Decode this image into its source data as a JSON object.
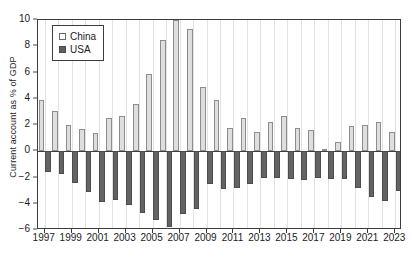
{
  "chart_data": {
    "type": "bar",
    "title": "",
    "xlabel": "",
    "ylabel": "Current account as % of GDP",
    "ylim": [
      -6,
      10
    ],
    "yticks": [
      10,
      8,
      6,
      4,
      2,
      0,
      -2,
      -4,
      -6
    ],
    "ytick_labels": [
      "10",
      "8",
      "6",
      "4",
      "2",
      "0",
      "−2",
      "−4",
      "−6"
    ],
    "grid": "vertical",
    "legend_position": "top-left",
    "categories": [
      "1997",
      "1998",
      "1999",
      "2000",
      "2001",
      "2002",
      "2003",
      "2004",
      "2005",
      "2006",
      "2007",
      "2008",
      "2009",
      "2010",
      "2011",
      "2012",
      "2013",
      "2014",
      "2015",
      "2016",
      "2017",
      "2018",
      "2019",
      "2020",
      "2021",
      "2022",
      "2023"
    ],
    "xtick_labels": [
      "1997",
      "1999",
      "2001",
      "2003",
      "2005",
      "2007",
      "2009",
      "2011",
      "2013",
      "2015",
      "2017",
      "2019",
      "2021",
      "2023"
    ],
    "series": [
      {
        "name": "China",
        "color": "#dedede",
        "values": [
          3.9,
          3.1,
          2.0,
          1.7,
          1.4,
          2.5,
          2.7,
          3.6,
          5.9,
          8.5,
          10.0,
          9.3,
          4.9,
          3.9,
          1.8,
          2.5,
          1.5,
          2.2,
          2.7,
          1.8,
          1.6,
          0.2,
          0.7,
          1.9,
          2.0,
          2.2,
          1.5
        ]
      },
      {
        "name": "USA",
        "color": "#636363",
        "values": [
          -1.6,
          -1.7,
          -2.4,
          -3.1,
          -3.9,
          -3.7,
          -4.1,
          -4.7,
          -5.2,
          -5.8,
          -4.8,
          -4.4,
          -2.5,
          -2.9,
          -2.8,
          -2.5,
          -2.0,
          -2.0,
          -2.1,
          -2.2,
          -2.0,
          -2.1,
          -2.1,
          -2.8,
          -3.5,
          -3.8,
          -3.0
        ]
      }
    ]
  },
  "legend": {
    "items": [
      {
        "label": "China"
      },
      {
        "label": "USA"
      }
    ]
  }
}
